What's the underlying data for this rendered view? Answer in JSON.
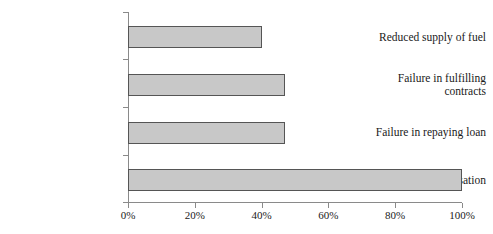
{
  "chart_data": {
    "type": "bar",
    "orientation": "horizontal",
    "title": "",
    "subtitle": "",
    "xlabel": "",
    "ylabel": "",
    "categories": [
      "Too low compensation",
      "Failure in repaying loan",
      "Failure in fulfilling contracts",
      "Reduced supply of fuel"
    ],
    "category_lines": [
      [
        "Too low compensation"
      ],
      [
        "Failure in repaying loan"
      ],
      [
        "Failure in fulfilling",
        "contracts"
      ],
      [
        "Reduced supply of fuel"
      ]
    ],
    "values": [
      100,
      47,
      47,
      40
    ],
    "value_labels": [
      "100%",
      "47%",
      "47%",
      "40%"
    ],
    "xlim": [
      0,
      100
    ],
    "xticks": [
      0,
      20,
      40,
      60,
      80,
      100
    ],
    "xtick_labels": [
      "0%",
      "20%",
      "40%",
      "60%",
      "80%",
      "100%"
    ],
    "grid": false,
    "legend": false,
    "bar_fill_color": "#c8c8c8",
    "bar_border_color": "#555555",
    "axis_color": "#8a8a8a",
    "background_color": "#ffffff"
  }
}
